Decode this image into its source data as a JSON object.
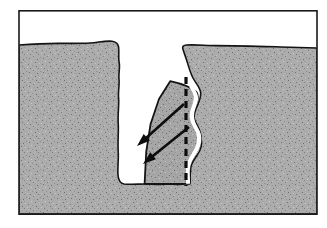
{
  "figure": {
    "title": "Cross-section of a soil crevasse with detaching wedge block",
    "domain": "diagram",
    "type": "geological-cross-section",
    "width": 327,
    "height": 228,
    "background_color": "#ffffff",
    "caption": "",
    "labels": []
  },
  "frame": {
    "name": "figure-border",
    "x": 18,
    "y": 10,
    "width": 300,
    "height": 205,
    "stroke_color": "#1a1a1a",
    "stroke_width": 1.6,
    "fill_color": "#ffffff"
  },
  "sky": {
    "name": "air-void-above-ground",
    "fill_color": "#ffffff",
    "description": "Open white space above the ground surface"
  },
  "ground": {
    "name": "soil-mass",
    "fill_color": "#a9a9a9",
    "texture": "fine-speckle",
    "speckle_color": "#6f6f6f",
    "speckle_light_color": "#c8c8c8",
    "outline_color": "#141414",
    "outline_width": 1.6,
    "surface_y_left": 43,
    "surface_y_right": 47,
    "base_y": 214,
    "left_x": 19,
    "right_x": 317,
    "description": "Granular soil / sediment mass shown in cross section"
  },
  "crevasse": {
    "name": "crevasse-void",
    "fill_color": "#ffffff",
    "outline_color": "#141414",
    "outline_width": 1.8,
    "mouth_left_x": 114,
    "mouth_right_x": 181,
    "floor_y": 184,
    "description": "Open vertical fissure / crevasse cut into the soil"
  },
  "wedge": {
    "name": "detaching-wedge-block",
    "fill_color": "#a3a3a3",
    "texture": "fine-speckle",
    "outline_color": "#141414",
    "outline_width": 1.8,
    "apex_x": 170,
    "apex_y": 81,
    "base_y": 184,
    "description": "Triangular wedge of soil separating from the crevasse wall"
  },
  "failure_plane": {
    "name": "dashed-failure-plane",
    "stroke_color": "#0d0d0d",
    "stroke_width": 3.2,
    "dash_pattern": "7 5",
    "x": 186,
    "y_top": 77,
    "y_bottom": 186,
    "description": "Vertical dashed line marking the failure / separation plane"
  },
  "arrows": [
    {
      "name": "displacement-arrow-upper",
      "x1": 184,
      "y1": 104,
      "x2": 137,
      "y2": 146,
      "stroke_color": "#0d0d0d",
      "stroke_width": 2.6,
      "head_length": 13,
      "head_width": 9,
      "direction": "down-left",
      "label": ""
    },
    {
      "name": "displacement-arrow-lower",
      "x1": 189,
      "y1": 127,
      "x2": 143,
      "y2": 164,
      "stroke_color": "#0d0d0d",
      "stroke_width": 2.6,
      "head_length": 13,
      "head_width": 9,
      "direction": "down-left",
      "label": ""
    }
  ],
  "colors": {
    "soil": "#a9a9a9",
    "wedge": "#a3a3a3",
    "void": "#ffffff",
    "ink": "#141414",
    "page": "#ffffff"
  }
}
